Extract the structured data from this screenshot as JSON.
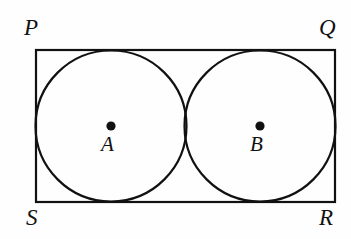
{
  "figure": {
    "background_color": "#fefefe",
    "stroke_color": "#111111",
    "fill_color": "none",
    "width": 351,
    "height": 239
  },
  "rectangle": {
    "name": "PQRS",
    "x": 36,
    "y": 50,
    "width": 299,
    "height": 152,
    "stroke_width": 2.2,
    "corners": {
      "top_left": {
        "label": "P",
        "x": 36,
        "y": 50
      },
      "top_right": {
        "label": "Q",
        "x": 335,
        "y": 50
      },
      "bottom_right": {
        "label": "R",
        "x": 335,
        "y": 202
      },
      "bottom_left": {
        "label": "S",
        "x": 36,
        "y": 202
      }
    }
  },
  "circles": [
    {
      "center_label": "A",
      "cx": 111,
      "cy": 126,
      "r": 75.5,
      "stroke_width": 2.2,
      "dot_radius": 4.6
    },
    {
      "center_label": "B",
      "cx": 260,
      "cy": 126,
      "r": 75.5,
      "stroke_width": 2.2,
      "dot_radius": 4.6
    }
  ],
  "labels": {
    "P": "P",
    "Q": "Q",
    "R": "R",
    "S": "S",
    "A": "A",
    "B": "B"
  }
}
